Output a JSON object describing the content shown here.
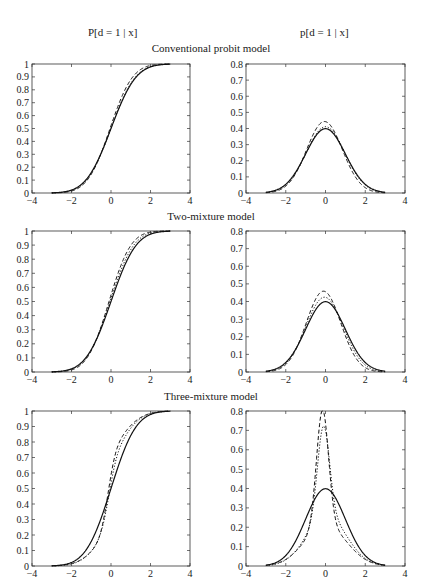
{
  "headers": {
    "left": "P[d = 1 | x]",
    "right": "p[d = 1 | x]"
  },
  "rows": [
    {
      "title": "Conventional probit model"
    },
    {
      "title": "Two-mixture model"
    },
    {
      "title": "Three-mixture model"
    }
  ],
  "chart_data": [
    {
      "type": "line",
      "panel": "row1-left",
      "title": "Conventional probit model",
      "ylabel": "P[d = 1 | x]",
      "xlim": [
        -4,
        4
      ],
      "ylim": [
        0,
        1
      ],
      "xticks": [
        -4,
        -2,
        0,
        2,
        4
      ],
      "yticks": [
        0,
        0.1,
        0.2,
        0.3,
        0.4,
        0.5,
        0.6,
        0.7,
        0.8,
        0.9,
        1
      ],
      "kind": "cdf",
      "series": [
        {
          "name": "solid",
          "style": "solid",
          "mu": 0.0,
          "sigma": 1.0
        },
        {
          "name": "dashed",
          "style": "dashed",
          "mu": -0.05,
          "sigma": 0.9
        },
        {
          "name": "dotted",
          "style": "dotted",
          "mu": 0.0,
          "sigma": 0.97
        }
      ]
    },
    {
      "type": "line",
      "panel": "row1-right",
      "title": "Conventional probit model",
      "ylabel": "p[d = 1 | x]",
      "xlim": [
        -4,
        4
      ],
      "ylim": [
        0,
        0.8
      ],
      "xticks": [
        -4,
        -2,
        0,
        2,
        4
      ],
      "yticks": [
        0,
        0.1,
        0.2,
        0.3,
        0.4,
        0.5,
        0.6,
        0.7,
        0.8
      ],
      "kind": "pdf",
      "peaks": {
        "solid": 0.4,
        "dashed": 0.45,
        "dotted": 0.41
      },
      "series": [
        {
          "name": "solid",
          "style": "solid",
          "mu": 0.0,
          "sigma": 1.0
        },
        {
          "name": "dashed",
          "style": "dashed",
          "mu": -0.05,
          "sigma": 0.9
        },
        {
          "name": "dotted",
          "style": "dotted",
          "mu": 0.0,
          "sigma": 0.97
        }
      ]
    },
    {
      "type": "line",
      "panel": "row2-left",
      "title": "Two-mixture model",
      "ylabel": "P[d = 1 | x]",
      "xlim": [
        -4,
        4
      ],
      "ylim": [
        0,
        1
      ],
      "xticks": [
        -4,
        -2,
        0,
        2,
        4
      ],
      "yticks": [
        0,
        0.1,
        0.2,
        0.3,
        0.4,
        0.5,
        0.6,
        0.7,
        0.8,
        0.9,
        1
      ],
      "kind": "cdf",
      "series": [
        {
          "name": "solid",
          "style": "solid",
          "mu": 0.0,
          "sigma": 1.0
        },
        {
          "name": "dashed",
          "style": "dashed",
          "mu": -0.1,
          "sigma": 0.87
        },
        {
          "name": "dotted",
          "style": "dotted",
          "mu": -0.05,
          "sigma": 0.94
        }
      ]
    },
    {
      "type": "line",
      "panel": "row2-right",
      "title": "Two-mixture model",
      "ylabel": "p[d = 1 | x]",
      "xlim": [
        -4,
        4
      ],
      "ylim": [
        0,
        0.8
      ],
      "xticks": [
        -4,
        -2,
        0,
        2,
        4
      ],
      "yticks": [
        0,
        0.1,
        0.2,
        0.3,
        0.4,
        0.5,
        0.6,
        0.7,
        0.8
      ],
      "kind": "pdf",
      "peaks": {
        "solid": 0.4,
        "dashed": 0.46,
        "dotted": 0.42
      },
      "series": [
        {
          "name": "solid",
          "style": "solid",
          "mu": 0.0,
          "sigma": 1.0
        },
        {
          "name": "dashed",
          "style": "dashed",
          "mu": -0.1,
          "sigma": 0.87
        },
        {
          "name": "dotted",
          "style": "dotted",
          "mu": -0.05,
          "sigma": 0.94
        }
      ]
    },
    {
      "type": "line",
      "panel": "row3-left",
      "title": "Three-mixture model",
      "ylabel": "P[d = 1 | x]",
      "xlim": [
        -4,
        4
      ],
      "ylim": [
        0,
        1
      ],
      "xticks": [
        -4,
        -2,
        0,
        2,
        4
      ],
      "yticks": [
        0,
        0.1,
        0.2,
        0.3,
        0.4,
        0.5,
        0.6,
        0.7,
        0.8,
        0.9,
        1
      ],
      "kind": "cdf",
      "series": [
        {
          "name": "solid",
          "style": "solid",
          "mix": [
            [
              1.0,
              0.0,
              1.0
            ]
          ]
        },
        {
          "name": "dashed",
          "style": "dashed",
          "mix": [
            [
              0.45,
              -0.15,
              0.3
            ],
            [
              0.55,
              0.0,
              1.05
            ]
          ]
        },
        {
          "name": "dotted",
          "style": "dotted",
          "mix": [
            [
              0.35,
              -0.1,
              0.3
            ],
            [
              0.65,
              0.05,
              1.0
            ]
          ]
        }
      ]
    },
    {
      "type": "line",
      "panel": "row3-right",
      "title": "Three-mixture model",
      "ylabel": "p[d = 1 | x]",
      "xlim": [
        -4,
        4
      ],
      "ylim": [
        0,
        0.8
      ],
      "xticks": [
        -4,
        -2,
        0,
        2,
        4
      ],
      "yticks": [
        0,
        0.1,
        0.2,
        0.3,
        0.4,
        0.5,
        0.6,
        0.7,
        0.8
      ],
      "kind": "pdf",
      "peaks": {
        "solid": 0.4,
        "dashed": 0.68,
        "dotted": 0.55
      },
      "series": [
        {
          "name": "solid",
          "style": "solid",
          "mix": [
            [
              1.0,
              0.0,
              1.0
            ]
          ]
        },
        {
          "name": "dashed",
          "style": "dashed",
          "mix": [
            [
              0.45,
              -0.15,
              0.3
            ],
            [
              0.55,
              0.0,
              1.05
            ]
          ]
        },
        {
          "name": "dotted",
          "style": "dotted",
          "mix": [
            [
              0.35,
              -0.1,
              0.3
            ],
            [
              0.65,
              0.05,
              1.0
            ]
          ]
        }
      ]
    }
  ]
}
